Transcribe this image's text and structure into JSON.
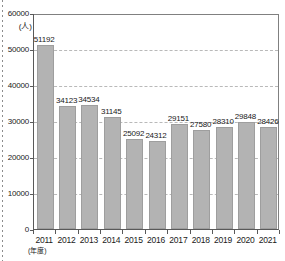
{
  "chart_data": {
    "type": "bar",
    "title": "",
    "xlabel": "(年度)",
    "ylabel": "(人)",
    "ylim": [
      0,
      60000
    ],
    "grid": true,
    "legend": "none",
    "categories": [
      "2011",
      "2012",
      "2013",
      "2014",
      "2015",
      "2016",
      "2017",
      "2018",
      "2019",
      "2020",
      "2021"
    ],
    "values": [
      51192,
      34123,
      34534,
      31145,
      25092,
      24312,
      29151,
      27580,
      28310,
      29848,
      28426
    ],
    "value_labels": [
      "51192",
      "34123",
      "34534",
      "31145",
      "25092",
      "24312",
      "29151",
      "27580",
      "28310",
      "29848",
      "28426"
    ],
    "y_ticks": [
      60000,
      50000,
      40000,
      30000,
      20000,
      10000,
      0
    ],
    "y_tick_labels": [
      "60000",
      "50000",
      "40000",
      "30000",
      "20000",
      "10000",
      "0"
    ],
    "colors": {
      "bar_fill": "#b3b3b3",
      "bar_stroke": "#9e9e9e",
      "gridline": "#b9b9b9",
      "axis": "#595959",
      "text": "#1a1a1a",
      "background": "#ffffff"
    }
  }
}
